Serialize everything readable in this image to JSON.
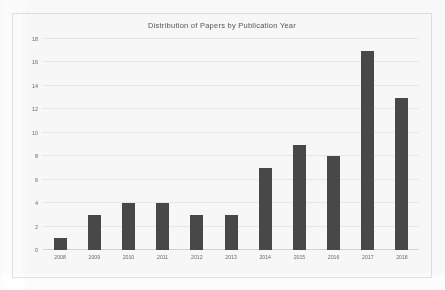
{
  "chart_data": {
    "type": "bar",
    "title": "Distribution of Papers by Publication Year",
    "xlabel": "",
    "ylabel": "",
    "categories": [
      "2008",
      "2009",
      "2010",
      "2011",
      "2012",
      "2013",
      "2014",
      "2015",
      "2016",
      "2017",
      "2018"
    ],
    "values": [
      1,
      3,
      4,
      4,
      3,
      3,
      7,
      9,
      8,
      17,
      13
    ],
    "series": [
      {
        "name": "Papers",
        "values": [
          1,
          3,
          4,
          4,
          3,
          3,
          7,
          9,
          8,
          17,
          13
        ]
      }
    ],
    "ylim": [
      0,
      18
    ],
    "ytick_labels": [
      "0",
      "2",
      "4",
      "6",
      "8",
      "10",
      "12",
      "14",
      "16",
      "18"
    ],
    "ytick_values": [
      0,
      2,
      4,
      6,
      8,
      10,
      12,
      14,
      16,
      18
    ],
    "grid": true,
    "grid_axis": "y",
    "legend": false,
    "legend_position": "none",
    "bar_color": "#4a4a4a",
    "grid_color": "#ededed",
    "axis_color": "#d8d8d8",
    "background_color": "#fefefe",
    "border_color": "#e3e3e3",
    "title_color": "#585858",
    "tick_label_color": "#6d6d6d"
  }
}
